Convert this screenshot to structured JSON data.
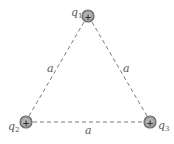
{
  "diagram": {
    "charges": [
      {
        "id": "q1",
        "label": "q",
        "subscript": "1",
        "sign": "+",
        "cx": 88,
        "cy": 16,
        "label_x": 71,
        "label_y": 16
      },
      {
        "id": "q2",
        "label": "q",
        "subscript": "2",
        "sign": "+",
        "cx": 26,
        "cy": 122,
        "label_x": 8,
        "label_y": 130
      },
      {
        "id": "q3",
        "label": "q",
        "subscript": "3",
        "sign": "+",
        "cx": 150,
        "cy": 122,
        "label_x": 157,
        "label_y": 129
      }
    ],
    "sides": [
      {
        "from": "q1",
        "to": "q2",
        "label": "a",
        "label_x": 47,
        "label_y": 72
      },
      {
        "from": "q1",
        "to": "q3",
        "label": "a",
        "label_x": 123,
        "label_y": 72
      },
      {
        "from": "q2",
        "to": "q3",
        "label": "a",
        "label_x": 85,
        "label_y": 134
      }
    ],
    "colors": {
      "charge_fill": "#9a9a9a",
      "charge_stroke": "#6a6a6a",
      "line": "#7a7a7a",
      "text": "#555555"
    }
  }
}
